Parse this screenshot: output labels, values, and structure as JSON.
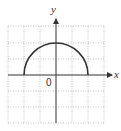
{
  "diagram": {
    "type": "coordinate-plane-graph",
    "axes": {
      "x_label": "x",
      "y_label": "y",
      "origin_label": "0"
    },
    "grid": {
      "columns": 6,
      "rows": 6,
      "x_range": [
        -3,
        3
      ],
      "y_range": [
        -3,
        3
      ],
      "style": "dotted",
      "color": "#b0b0b0"
    },
    "curve": {
      "shape": "upper-semicircle",
      "center": [
        0,
        0
      ],
      "radius": 2,
      "x_extent": [
        -2,
        2
      ],
      "y_max": 2,
      "color": "#333333"
    },
    "colors": {
      "axis": "#333333",
      "grid": "#b0b0b0",
      "curve": "#333333"
    }
  }
}
